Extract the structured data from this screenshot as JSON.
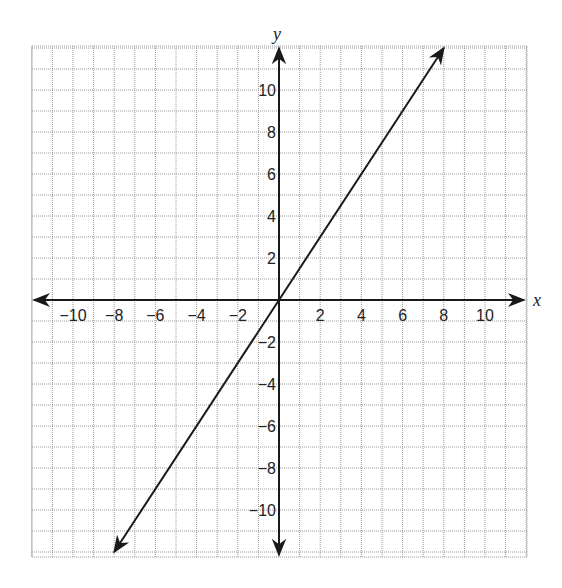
{
  "chart_data": {
    "type": "line",
    "title": "",
    "xlabel": "x",
    "ylabel": "y",
    "xlim": [
      -12,
      12
    ],
    "ylim": [
      -12.3,
      12
    ],
    "grid": true,
    "grid_step": 1,
    "x_ticks": [
      -10,
      -8,
      -6,
      -4,
      -2,
      2,
      4,
      6,
      8,
      10
    ],
    "x_tick_labels": [
      "−10",
      "−8",
      "−6",
      "−4",
      "−2",
      "2",
      "4",
      "6",
      "8",
      "10"
    ],
    "y_ticks": [
      10,
      8,
      6,
      4,
      2,
      -2,
      -4,
      -6,
      -8,
      -10
    ],
    "y_tick_labels": [
      "10",
      "8",
      "6",
      "4",
      "2",
      "−2",
      "−4",
      "−6",
      "−8",
      "−10"
    ],
    "series": [
      {
        "name": "y = 1.5x",
        "equation": "y = 1.5x",
        "slope": 1.5,
        "intercept": 0,
        "x": [
          -8,
          0,
          8
        ],
        "y": [
          -12,
          0,
          12
        ],
        "arrows_both_ends": true,
        "color": "#1a1a1a"
      }
    ]
  },
  "labels": {
    "x_axis": "x",
    "y_axis": "y"
  },
  "colors": {
    "grid": "#9a9a9a",
    "axis": "#1a1a1a",
    "line": "#1a1a1a"
  }
}
